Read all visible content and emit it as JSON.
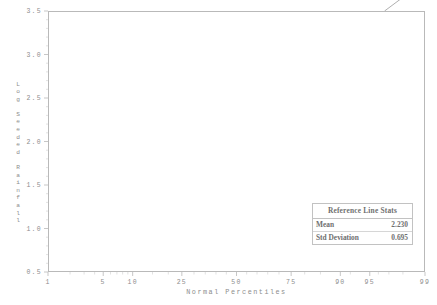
{
  "chart_data": {
    "type": "scatter",
    "title": "",
    "xlabel": "Normal Percentiles",
    "ylabel": "Log Seeded Rainfall",
    "xscale": "probit",
    "xticks": [
      1,
      5,
      10,
      25,
      50,
      75,
      90,
      95,
      99
    ],
    "xticklabels": [
      "1",
      "5",
      "10",
      "25",
      "50",
      "75",
      "90",
      "95",
      "99"
    ],
    "yticks": [
      0.5,
      1.0,
      1.5,
      2.0,
      2.5,
      3.0,
      3.5
    ],
    "yticklabels": [
      "0.5",
      "1.0",
      "1.5",
      "2.0",
      "2.5",
      "3.0",
      "3.5"
    ],
    "xlim": [
      1,
      99
    ],
    "ylim": [
      0.5,
      3.5
    ],
    "grid": false,
    "legend": false,
    "marker": "filled-circle",
    "marker_color": "#4a4a4a",
    "line_color": "#9a9a9a",
    "points": [
      {
        "percentile": 2.0,
        "value": 0.62
      },
      {
        "percentile": 6.0,
        "value": 0.89
      },
      {
        "percentile": 10.0,
        "value": 1.25
      },
      {
        "percentile": 15.0,
        "value": 1.5
      },
      {
        "percentile": 18.5,
        "value": 1.52
      },
      {
        "percentile": 22.0,
        "value": 1.61
      },
      {
        "percentile": 26.0,
        "value": 1.97
      },
      {
        "percentile": 30.0,
        "value": 2.06
      },
      {
        "percentile": 34.0,
        "value": 2.07
      },
      {
        "percentile": 38.0,
        "value": 2.07
      },
      {
        "percentile": 42.0,
        "value": 2.1
      },
      {
        "percentile": 46.0,
        "value": 2.3
      },
      {
        "percentile": 49.5,
        "value": 2.3
      },
      {
        "percentile": 53.5,
        "value": 2.38
      },
      {
        "percentile": 57.0,
        "value": 2.4
      },
      {
        "percentile": 61.0,
        "value": 2.44
      },
      {
        "percentile": 65.0,
        "value": 2.44
      },
      {
        "percentile": 69.0,
        "value": 2.48
      },
      {
        "percentile": 72.0,
        "value": 2.53
      },
      {
        "percentile": 76.0,
        "value": 2.63
      },
      {
        "percentile": 79.0,
        "value": 2.69
      },
      {
        "percentile": 83.0,
        "value": 2.84
      },
      {
        "percentile": 86.5,
        "value": 2.98
      },
      {
        "percentile": 90.0,
        "value": 3.2
      },
      {
        "percentile": 93.0,
        "value": 3.21
      },
      {
        "percentile": 97.0,
        "value": 3.43
      }
    ],
    "reference_line": {
      "label": "Reference Line Stats",
      "mean": 2.23,
      "std_deviation": 0.695
    }
  },
  "stats_box": {
    "title": "Reference Line Stats",
    "rows": [
      {
        "label": "Mean",
        "value": "2.230"
      },
      {
        "label": "Std Deviation",
        "value": "0.695"
      }
    ]
  },
  "axes": {
    "x_title": "Normal Percentiles",
    "y_title_chars": [
      "L",
      "o",
      "g",
      " ",
      "S",
      "e",
      "e",
      "d",
      "e",
      "d",
      " ",
      "R",
      "a",
      "i",
      "n",
      "f",
      "a",
      "l",
      "l"
    ]
  }
}
